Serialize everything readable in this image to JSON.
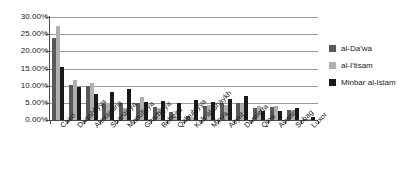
{
  "chart_data": {
    "type": "bar",
    "title": "",
    "subtitle": "",
    "xlabel": "",
    "ylabel": "",
    "ylim": [
      0,
      30
    ],
    "grid": true,
    "legend_position": "right",
    "ytick_labels": [
      "30.00%",
      "25.00%",
      "20.00%",
      "15.00%",
      "10.00%",
      "5.00%",
      "0.00%"
    ],
    "ytick_values": [
      30,
      25,
      20,
      15,
      10,
      5,
      0
    ],
    "categories": [
      "Cairo",
      "Daqahliyya",
      "Alexandria",
      "Sharqiyya",
      "Monufiyya",
      "Gharbiyya",
      "Beheira",
      "Qalyubiyya",
      "Kafr al-Shaykh",
      "Minya",
      "Asyut",
      "Damietta",
      "Qina",
      "Aswan",
      "Sohag",
      "Luxor"
    ],
    "series": [
      {
        "name": "al-Da'wa",
        "color": "#595959",
        "values": [
          24.0,
          10.3,
          10.0,
          4.8,
          4.9,
          5.0,
          3.7,
          2.4,
          1.1,
          4.2,
          4.9,
          5.0,
          3.4,
          3.7,
          3.0,
          0.4
        ]
      },
      {
        "name": "al-I'tisam",
        "color": "#b0b0b0",
        "values": [
          27.5,
          11.6,
          10.8,
          5.1,
          3.6,
          6.7,
          3.6,
          1.2,
          1.0,
          4.4,
          4.4,
          4.7,
          4.2,
          4.0,
          2.9,
          0.3
        ]
      },
      {
        "name": "Minbar al-Islam",
        "color": "#1a1a1a",
        "values": [
          15.5,
          9.7,
          7.6,
          8.1,
          8.9,
          5.3,
          5.6,
          5.0,
          5.9,
          5.3,
          6.0,
          7.0,
          2.7,
          2.7,
          3.4,
          0.9
        ]
      }
    ]
  },
  "legend": {
    "items": [
      {
        "label": "al-Da'wa",
        "color": "#595959"
      },
      {
        "label": "al-I'tisam",
        "color": "#b0b0b0"
      },
      {
        "label": "Minbar al-Islam",
        "color": "#1a1a1a"
      }
    ]
  }
}
